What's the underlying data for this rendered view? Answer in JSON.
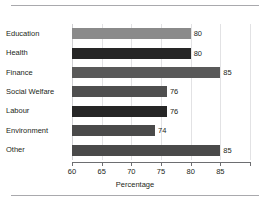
{
  "chart_data": {
    "type": "bar",
    "orientation": "horizontal",
    "title": "",
    "xlabel": "Percentage",
    "ylabel": "",
    "xlim": [
      60,
      90
    ],
    "grid": true,
    "legend": "none",
    "xticks": [
      60,
      65,
      70,
      75,
      80,
      85
    ],
    "xtick_labels": [
      "60",
      "65",
      "70",
      "75",
      "80",
      "85"
    ],
    "categories": [
      "Education",
      "Health",
      "Finance",
      "Social Welfare",
      "Labour",
      "Environment",
      "Other"
    ],
    "values": [
      80,
      80,
      85,
      76,
      76,
      74,
      85
    ],
    "value_labels": [
      "80",
      "80",
      "85",
      "76",
      "76",
      "74",
      "85"
    ],
    "bar_colors": [
      "#8a8a8a",
      "#262626",
      "#595959",
      "#4f4f4f",
      "#262626",
      "#4a4a4a",
      "#4a4a4a"
    ]
  },
  "decor": {
    "rule_color": "#a9a9ad"
  }
}
